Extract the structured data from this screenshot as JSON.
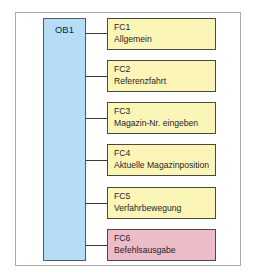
{
  "diagram": {
    "main_block": {
      "label": "OB1",
      "color": "#b5ddf6"
    },
    "functions": [
      {
        "id": "FC1",
        "name": "Allgemein",
        "color": "#fbf5b8"
      },
      {
        "id": "FC2",
        "name": "Referenzfahrt",
        "color": "#fbf5b8"
      },
      {
        "id": "FC3",
        "name": "Magazin-Nr. eingeben",
        "color": "#fbf5b8"
      },
      {
        "id": "FC4",
        "name": "Aktuelle Magazinposition",
        "color": "#fbf5b8"
      },
      {
        "id": "FC5",
        "name": "Verfahrbewegung",
        "color": "#fbf5b8"
      },
      {
        "id": "FC6",
        "name": "Befehlsausgabe",
        "color": "#ecbcc9"
      }
    ]
  }
}
